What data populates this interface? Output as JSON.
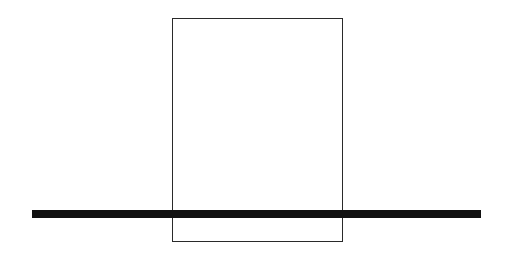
{
  "diagram": {
    "background": "#ffffff",
    "shapes": [
      {
        "id": "rectangle",
        "kind": "rectangle-outline",
        "x": 172,
        "y": 18,
        "width": 171,
        "height": 224,
        "stroke": "#2a2a2a"
      },
      {
        "id": "horizontal-bar",
        "kind": "thick-line",
        "x": 32,
        "y": 210,
        "width": 449,
        "height": 8,
        "fill": "#111111"
      }
    ]
  }
}
